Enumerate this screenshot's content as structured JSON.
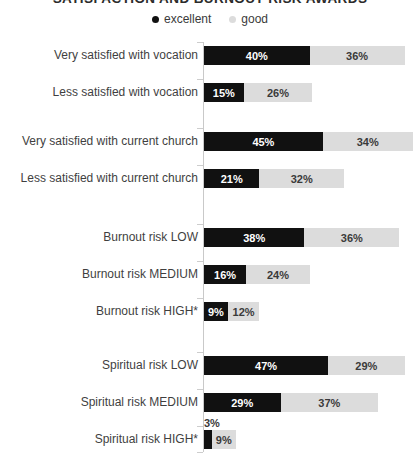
{
  "title": "SATISFACTION AND BURNOUT RISK AWARDS",
  "legend": {
    "position": "top-center",
    "items": [
      {
        "label": "excellent",
        "color": "#111111"
      },
      {
        "label": "good",
        "color": "#dcdcdc"
      }
    ]
  },
  "colors": {
    "excellent": "#111111",
    "good": "#dcdcdc",
    "axis": "#c9c9c9",
    "label_text": "#3f3f3f",
    "background": "#ffffff"
  },
  "chart_data": {
    "type": "bar",
    "orientation": "horizontal",
    "stacked": true,
    "title": "SATISFACTION AND BURNOUT RISK AWARDS",
    "xlabel": "",
    "ylabel": "",
    "xlim": [
      0,
      82
    ],
    "grid": false,
    "legend_position": "top-center",
    "value_suffix": "%",
    "categories": [
      "Very satisfied with vocation",
      "Less satisfied with vocation",
      "Very satisfied with current church",
      "Less satisfied with current church",
      "Burnout risk LOW",
      "Burnout risk MEDIUM",
      "Burnout risk HIGH*",
      "Spiritual risk LOW",
      "Spiritual risk MEDIUM",
      "Spiritual risk HIGH*"
    ],
    "series": [
      {
        "name": "excellent",
        "color": "#111111",
        "values": [
          40,
          15,
          45,
          21,
          38,
          16,
          9,
          47,
          29,
          3
        ]
      },
      {
        "name": "good",
        "color": "#dcdcdc",
        "values": [
          36,
          26,
          34,
          32,
          36,
          24,
          12,
          29,
          37,
          9
        ]
      }
    ],
    "groups": [
      {
        "name": "vocation satisfaction",
        "categories": [
          0,
          1
        ]
      },
      {
        "name": "current church satisfaction",
        "categories": [
          2,
          3
        ]
      },
      {
        "name": "burnout risk",
        "categories": [
          4,
          5,
          6
        ]
      },
      {
        "name": "spiritual risk",
        "categories": [
          7,
          8,
          9
        ]
      }
    ]
  },
  "rows": [
    {
      "label": "Very satisfied with vocation",
      "top": 8,
      "excellent": {
        "value": 40,
        "text": "40%",
        "inside": true
      },
      "good": {
        "value": 36,
        "text": "36%",
        "inside": true
      }
    },
    {
      "label": "Less satisfied with vocation",
      "top": 45,
      "excellent": {
        "value": 15,
        "text": "15%",
        "inside": true
      },
      "good": {
        "value": 26,
        "text": "26%",
        "inside": true
      }
    },
    {
      "label": "Very satisfied with current church",
      "top": 94,
      "excellent": {
        "value": 45,
        "text": "45%",
        "inside": true
      },
      "good": {
        "value": 34,
        "text": "34%",
        "inside": true
      }
    },
    {
      "label": "Less satisfied with current church",
      "top": 131,
      "excellent": {
        "value": 21,
        "text": "21%",
        "inside": true
      },
      "good": {
        "value": 32,
        "text": "32%",
        "inside": true
      }
    },
    {
      "label": "Burnout risk LOW",
      "top": 190,
      "excellent": {
        "value": 38,
        "text": "38%",
        "inside": true
      },
      "good": {
        "value": 36,
        "text": "36%",
        "inside": true
      }
    },
    {
      "label": "Burnout risk MEDIUM",
      "top": 227,
      "excellent": {
        "value": 16,
        "text": "16%",
        "inside": true
      },
      "good": {
        "value": 24,
        "text": "24%",
        "inside": true
      }
    },
    {
      "label": "Burnout risk HIGH*",
      "top": 264,
      "excellent": {
        "value": 9,
        "text": "9%",
        "inside": true
      },
      "good": {
        "value": 12,
        "text": "12%",
        "inside": true
      }
    },
    {
      "label": "Spiritual risk LOW",
      "top": 318,
      "excellent": {
        "value": 47,
        "text": "47%",
        "inside": true
      },
      "good": {
        "value": 29,
        "text": "29%",
        "inside": true
      }
    },
    {
      "label": "Spiritual risk MEDIUM",
      "top": 355,
      "excellent": {
        "value": 29,
        "text": "29%",
        "inside": true
      },
      "good": {
        "value": 37,
        "text": "37%",
        "inside": true
      }
    },
    {
      "label": "Spiritual risk HIGH*",
      "top": 392,
      "excellent": {
        "value": 3,
        "text": "3%",
        "inside": false
      },
      "good": {
        "value": 9,
        "text": "9%",
        "inside": true
      }
    }
  ],
  "axis": {
    "ticks_top": [
      4,
      41,
      90,
      127,
      186,
      223,
      260,
      314,
      351,
      388,
      414
    ]
  },
  "scale_px_per_percent": 2.64
}
